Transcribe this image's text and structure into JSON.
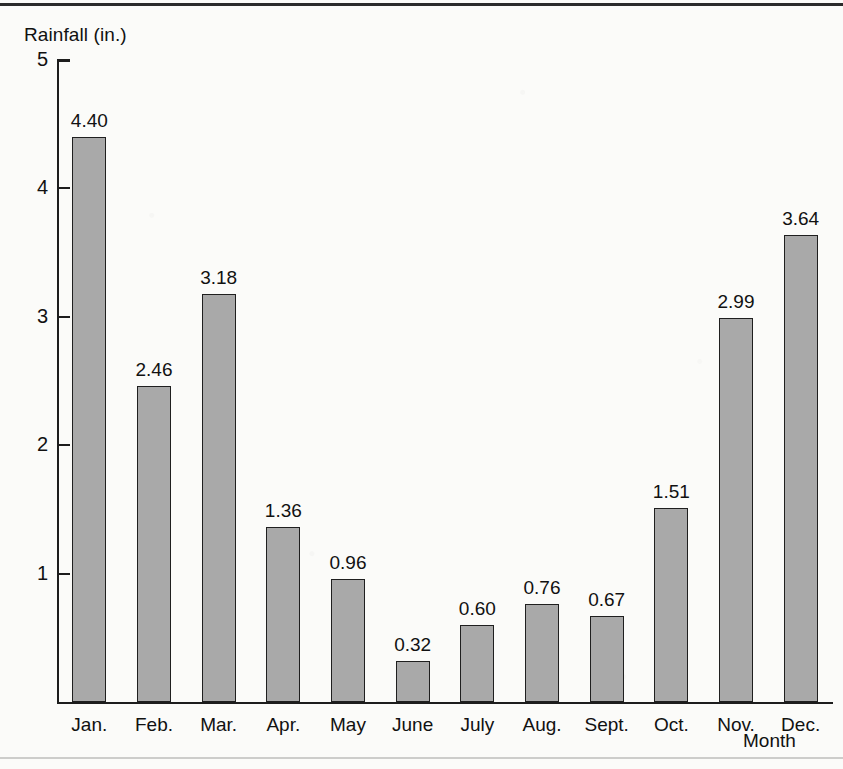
{
  "figure": {
    "axis_title_y": "Rainfall (in.)",
    "axis_title_x": "Month",
    "bar_fill_color": "#a9a9a9",
    "bar_stroke_color": "#1f1f1f",
    "axis_color": "#1d1d1d",
    "background_color": "#fbfbf9"
  },
  "chart_data": {
    "type": "bar",
    "title": "",
    "subtitle": "",
    "xlabel": "Month",
    "ylabel": "Rainfall (in.)",
    "categories": [
      "Jan.",
      "Feb.",
      "Mar.",
      "Apr.",
      "May",
      "June",
      "July",
      "Aug.",
      "Sept.",
      "Oct.",
      "Nov.",
      "Dec."
    ],
    "values": [
      4.4,
      2.46,
      3.18,
      1.36,
      0.96,
      0.32,
      0.6,
      0.76,
      0.67,
      1.51,
      2.99,
      3.64
    ],
    "value_labels": [
      "4.40",
      "2.46",
      "3.18",
      "1.36",
      "0.96",
      "0.32",
      "0.60",
      "0.76",
      "0.67",
      "1.51",
      "2.99",
      "3.64"
    ],
    "ylim": [
      0,
      5
    ],
    "yticks": [
      1,
      2,
      3,
      4,
      5
    ],
    "ytick_labels": [
      "1",
      "2",
      "3",
      "4",
      "5"
    ],
    "grid": false,
    "legend": null,
    "series": [
      {
        "name": "Rainfall",
        "values": [
          4.4,
          2.46,
          3.18,
          1.36,
          0.96,
          0.32,
          0.6,
          0.76,
          0.67,
          1.51,
          2.99,
          3.64
        ]
      }
    ]
  }
}
